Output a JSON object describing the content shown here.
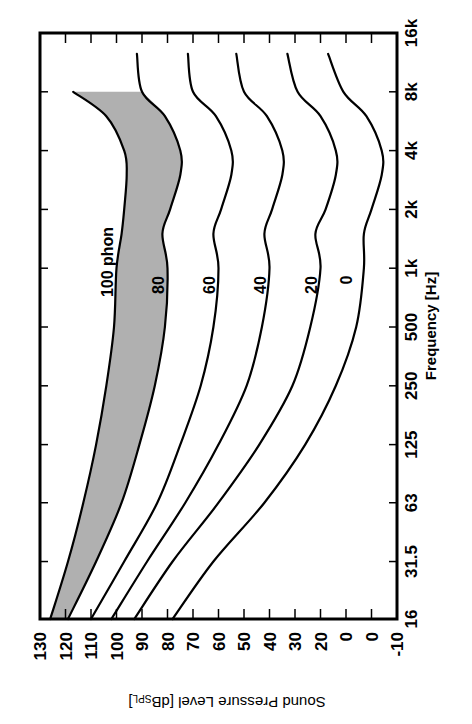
{
  "chart_data": {
    "type": "line",
    "title": "",
    "orientation": "rotated 90° clockwise (frequency runs bottom-to-top along the right side, SPL runs right-to-left along the bottom)",
    "xlabel": "Frequency [Hz]",
    "ylabel": "Sound Pressure Level [dB",
    "ylabel_sub": "SPL",
    "ylabel_end": "]",
    "x_scale": "log",
    "x_ticks": [
      "16",
      "31.5",
      "63",
      "125",
      "250",
      "500",
      "1k",
      "2k",
      "4k",
      "8k",
      "16k"
    ],
    "x_tick_values": [
      16,
      31.5,
      63,
      125,
      250,
      500,
      1000,
      2000,
      4000,
      8000,
      16000
    ],
    "y_ticks": [
      "130",
      "120",
      "110",
      "100",
      "90",
      "80",
      "70",
      "60",
      "50",
      "40",
      "30",
      "20",
      "0",
      "0",
      "-10"
    ],
    "y_tick_values": [
      130,
      120,
      110,
      100,
      90,
      80,
      70,
      60,
      50,
      40,
      30,
      20,
      10,
      0,
      -10
    ],
    "ylim": [
      -10,
      130
    ],
    "xlim": [
      16,
      16000
    ],
    "grid": false,
    "shaded_region": {
      "between": [
        "100 phon",
        "80 phon"
      ],
      "color": "#b0b0b0"
    },
    "x": [
      16,
      31.5,
      63,
      125,
      250,
      500,
      1000,
      1500,
      2000,
      3000,
      4000,
      6000,
      8000,
      12500
    ],
    "series": [
      {
        "name": "100 phon",
        "label": "100 phon",
        "values": [
          126,
          119,
          113,
          108,
          104,
          101,
          100,
          98,
          97,
          96,
          97,
          104,
          117,
          null
        ]
      },
      {
        "name": "80 phon",
        "label": "80",
        "values": [
          119,
          108,
          98,
          91,
          85,
          81,
          80,
          82,
          79,
          75,
          75,
          81,
          90,
          92
        ]
      },
      {
        "name": "60 phon",
        "label": "60",
        "values": [
          110,
          97,
          84,
          75,
          67,
          62,
          60,
          62,
          59,
          55,
          55,
          61,
          70,
          72
        ]
      },
      {
        "name": "40 phon",
        "label": "40",
        "values": [
          102,
          88,
          73,
          60,
          49,
          43,
          40,
          42,
          39,
          35,
          35,
          41,
          50,
          53
        ]
      },
      {
        "name": "20 phon",
        "label": "20",
        "values": [
          93,
          78,
          60,
          44,
          31,
          24,
          20,
          22,
          18,
          14,
          14,
          20,
          29,
          33
        ]
      },
      {
        "name": "0 phon",
        "label": "0",
        "values": [
          78,
          62,
          42,
          26,
          14,
          6,
          3,
          3,
          0,
          -4,
          -4,
          2,
          11,
          17
        ]
      }
    ]
  }
}
